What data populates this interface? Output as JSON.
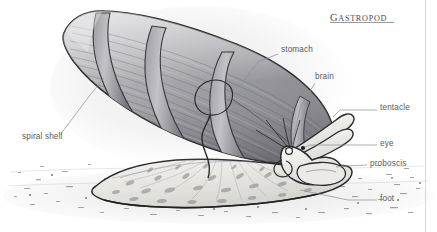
{
  "figure": {
    "title": "Gastropod",
    "title_display_first": "G",
    "title_display_rest": "ASTROPOD",
    "style": "pencil-shaded-line-drawing",
    "background_color": "#ffffff",
    "ink_color": "#2b2b2d",
    "label_color": "#5a5a5c",
    "leader_color": "#8d8d92"
  },
  "labels": [
    {
      "id": "spiral-shell",
      "text": "spiral shell",
      "x": 22,
      "y": 138,
      "align": "left"
    },
    {
      "id": "stomach",
      "text": "stomach",
      "x": 281,
      "y": 51,
      "align": "left"
    },
    {
      "id": "brain",
      "text": "brain",
      "x": 315,
      "y": 78,
      "align": "left"
    },
    {
      "id": "tentacle",
      "text": "tentacle",
      "x": 380,
      "y": 108,
      "align": "left"
    },
    {
      "id": "eye",
      "text": "eye",
      "x": 380,
      "y": 143,
      "align": "left"
    },
    {
      "id": "proboscis",
      "text": "proboscis",
      "x": 370,
      "y": 163,
      "align": "left"
    },
    {
      "id": "foot",
      "text": "foot",
      "x": 380,
      "y": 199,
      "align": "left"
    }
  ],
  "anatomy_parts": [
    "spiral shell",
    "stomach",
    "brain",
    "tentacle",
    "eye",
    "proboscis",
    "foot"
  ]
}
